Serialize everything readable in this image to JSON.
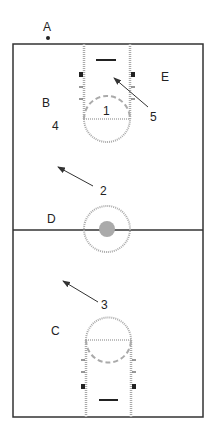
{
  "diagram": {
    "type": "basketball-court-positions",
    "colors": {
      "court_line": "#333333",
      "lane_line": "#aaaaaa",
      "center_fill": "#aaaaaa",
      "text": "#222222",
      "block": "#222222"
    }
  },
  "labels": {
    "player_a": "A",
    "player_b": "B",
    "player_c": "C",
    "player_d": "D",
    "player_e": "E",
    "move_1": "1",
    "move_2": "2",
    "move_3": "3",
    "move_4": "4",
    "move_5": "5"
  },
  "arrows": [
    {
      "id": "2",
      "from": [
        93,
        186
      ],
      "to": [
        58,
        167
      ]
    },
    {
      "id": "3",
      "from": [
        98,
        302
      ],
      "to": [
        63,
        281
      ]
    },
    {
      "id": "5",
      "from": [
        148,
        107
      ],
      "to": [
        114,
        78
      ]
    }
  ]
}
